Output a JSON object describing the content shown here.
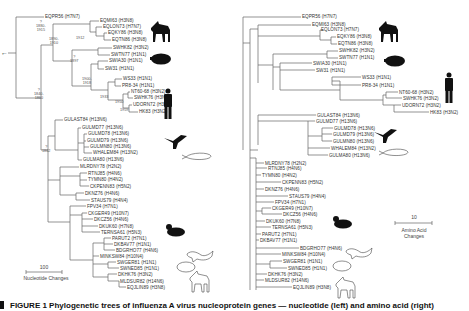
{
  "figure": {
    "caption": "FIGURE 1  Phylogenetic trees of influenza A virus nucleoprotein genes — nucleotide (left) and amino acid (right)",
    "left_tree": {
      "scale_value": "100",
      "scale_label": "Nucleotide Changes",
      "root_arrow": "←",
      "dates": [
        {
          "text": "1912",
          "x": 80,
          "y": 37
        },
        {
          "text": "1880-\n1910",
          "x": 8,
          "y": 32
        },
        {
          "text": "?\n1880-\n1915",
          "x": 127,
          "y": 40
        },
        {
          "text": "?\n1897",
          "x": 151,
          "y": 63
        },
        {
          "text": "1900-\n1918",
          "x": 107,
          "y": 93
        },
        {
          "text": "1933",
          "x": 130,
          "y": 95
        },
        {
          "text": "1950",
          "x": 117,
          "y": 118
        },
        {
          "text": "1959",
          "x": 100,
          "y": 127
        },
        {
          "text": "?\n1840-\n1860",
          "x": 31,
          "y": 97
        },
        {
          "text": "?\n1862",
          "x": 42,
          "y": 119
        }
      ],
      "taxa": [
        {
          "name": "EQPR56 (H7N7)",
          "x": 45,
          "y": 16
        },
        {
          "name": "EQMI63 (H3N8)",
          "x": 100,
          "y": 20
        },
        {
          "name": "EQLON73 (H7N7)",
          "x": 103,
          "y": 26
        },
        {
          "name": "EQKY86 (H3N8)",
          "x": 108,
          "y": 32
        },
        {
          "name": "EQTN86 (H3N8)",
          "x": 112,
          "y": 39
        },
        {
          "name": "SWHK82 (H3N2)",
          "x": 113,
          "y": 47
        },
        {
          "name": "SWTN77 (H1N1)",
          "x": 111,
          "y": 54
        },
        {
          "name": "SWIA30 (H1N1)",
          "x": 109,
          "y": 60
        },
        {
          "name": "SW31 (H1N1)",
          "x": 105,
          "y": 68
        },
        {
          "name": "WS33 (H1N1)",
          "x": 123,
          "y": 78
        },
        {
          "name": "PR8-34 (H1N1)",
          "x": 122,
          "y": 85
        },
        {
          "name": "NT60-68 (H3N2)",
          "x": 131,
          "y": 91
        },
        {
          "name": "SWHK76 (H3N2)",
          "x": 134,
          "y": 97
        },
        {
          "name": "UDORN72 (H3N2)",
          "x": 133,
          "y": 104
        },
        {
          "name": "HK83 (H3N2)",
          "x": 139,
          "y": 111
        },
        {
          "name": "GULAST84 (H13N6)",
          "x": 64,
          "y": 119
        },
        {
          "name": "GULMD77 (H13N6)",
          "x": 82,
          "y": 127
        },
        {
          "name": "GULMD78 (H13N6)",
          "x": 88,
          "y": 133
        },
        {
          "name": "GULMD79 (H13N6)",
          "x": 87,
          "y": 140
        },
        {
          "name": "GULMN80 (H13N6)",
          "x": 90,
          "y": 146
        },
        {
          "name": "WHALEM84 (H13N2)",
          "x": 93,
          "y": 152
        },
        {
          "name": "GULMA80 (H13N6)",
          "x": 83,
          "y": 159
        },
        {
          "name": "MLRDNY78 (H2N2)",
          "x": 80,
          "y": 166
        },
        {
          "name": "RTNJ85 (H4N6)",
          "x": 88,
          "y": 172
        },
        {
          "name": "TYMN80 (H4N2)",
          "x": 88,
          "y": 179
        },
        {
          "name": "CKPENN83 (H5N2)",
          "x": 90,
          "y": 185
        },
        {
          "name": "DKNZ76 (H4N6)",
          "x": 85,
          "y": 192
        },
        {
          "name": "STAUS79 (H4N4)",
          "x": 91,
          "y": 199
        },
        {
          "name": "FPV34 (H7N1)",
          "x": 87,
          "y": 205
        },
        {
          "name": "CKGER49 (H10N7)",
          "x": 88,
          "y": 212
        },
        {
          "name": "DKCZ56 (H4N6)",
          "x": 94,
          "y": 218
        },
        {
          "name": "DKUK60 (H7N8)",
          "x": 99,
          "y": 225
        },
        {
          "name": "TERNSA61 (H5N3)",
          "x": 101,
          "y": 231
        },
        {
          "name": "PARUT2 (H7N1)",
          "x": 112,
          "y": 237
        },
        {
          "name": "DKBAV77 (H1N1)",
          "x": 114,
          "y": 243
        },
        {
          "name": "BDGRHO77 (H4N6)",
          "x": 116,
          "y": 249
        },
        {
          "name": "MINKSW84 (H10N4)",
          "x": 100,
          "y": 255
        },
        {
          "name": "SWGER81 (H1N1)",
          "x": 117,
          "y": 261
        },
        {
          "name": "SWNED85 (H1N1)",
          "x": 120,
          "y": 267
        },
        {
          "name": "DKHK76 (H3N2)",
          "x": 118,
          "y": 273
        },
        {
          "name": "MLDSUR82 (H14N6)",
          "x": 120,
          "y": 280
        },
        {
          "name": "EQJLIN89 (H3N8)",
          "x": 127,
          "y": 286
        }
      ]
    },
    "right_tree": {
      "scale_value": "10",
      "scale_label_line1": "Amino Acid",
      "scale_label_line2": "Changes",
      "taxa": [
        {
          "name": "EQPR56 (H7N7)",
          "x": 302,
          "y": 16
        },
        {
          "name": "EQMI63 (H3N8)",
          "x": 312,
          "y": 24
        },
        {
          "name": "EQLON73 (H7N7)",
          "x": 321,
          "y": 29
        },
        {
          "name": "EQKY86 (H3N8)",
          "x": 337,
          "y": 36
        },
        {
          "name": "EQTN86 (H3N8)",
          "x": 338,
          "y": 43
        },
        {
          "name": "SWHK82 (H3N2)",
          "x": 339,
          "y": 50
        },
        {
          "name": "SWTN77 (H1N1)",
          "x": 339,
          "y": 57
        },
        {
          "name": "SWIA30 (H1N1)",
          "x": 313,
          "y": 62
        },
        {
          "name": "SW31 (H1N1)",
          "x": 316,
          "y": 69
        },
        {
          "name": "WS33 (H1N1)",
          "x": 362,
          "y": 76
        },
        {
          "name": "PR8-34 (H1N1)",
          "x": 362,
          "y": 84
        },
        {
          "name": "NT60-68 (H3N2)",
          "x": 399,
          "y": 91
        },
        {
          "name": "SWHK76 (H3N2)",
          "x": 403,
          "y": 97
        },
        {
          "name": "UDORN72 (H3N2)",
          "x": 402,
          "y": 104
        },
        {
          "name": "HK83 (H3N2)",
          "x": 430,
          "y": 111
        },
        {
          "name": "GULAST84 (H13N6)",
          "x": 317,
          "y": 114
        },
        {
          "name": "GULMD77 (H13N6)",
          "x": 316,
          "y": 120
        },
        {
          "name": "GULMD78 (H13N6)",
          "x": 334,
          "y": 127
        },
        {
          "name": "GULMD79 (H13N6)",
          "x": 333,
          "y": 133
        },
        {
          "name": "GULMN80 (H13N6)",
          "x": 333,
          "y": 140
        },
        {
          "name": "WHALEM84 (H13N2)",
          "x": 331,
          "y": 147
        },
        {
          "name": "GULMA80 (H13N6)",
          "x": 329,
          "y": 154
        },
        {
          "name": "MLRDNY78 (H2N2)",
          "x": 265,
          "y": 162
        },
        {
          "name": "RTNJ85 (H4N6)",
          "x": 268,
          "y": 167
        },
        {
          "name": "TYMN80 (H4N2)",
          "x": 262,
          "y": 174
        },
        {
          "name": "CKPENN83 (H5N2)",
          "x": 282,
          "y": 181
        },
        {
          "name": "DKNZ76 (H4N6)",
          "x": 265,
          "y": 188
        },
        {
          "name": "STAUS79 (H4N4)",
          "x": 289,
          "y": 195
        },
        {
          "name": "FPV34 (H7N1)",
          "x": 275,
          "y": 201
        },
        {
          "name": "CKGER49 (H10N7)",
          "x": 272,
          "y": 207
        },
        {
          "name": "DKCZ56 (H4N6)",
          "x": 283,
          "y": 213
        },
        {
          "name": "DKUK60 (H7N8)",
          "x": 266,
          "y": 220
        },
        {
          "name": "TERNSA61 (H5N3)",
          "x": 272,
          "y": 226
        },
        {
          "name": "PARUT2 (H7N1)",
          "x": 262,
          "y": 233
        },
        {
          "name": "DKBAV77 (H1N1)",
          "x": 260,
          "y": 239
        },
        {
          "name": "BDGRHO77 (H4N6)",
          "x": 300,
          "y": 247
        },
        {
          "name": "MINKSW84 (H10N4)",
          "x": 282,
          "y": 253
        },
        {
          "name": "SWGER81 (H1N1)",
          "x": 283,
          "y": 260
        },
        {
          "name": "SWNED85 (H1N1)",
          "x": 288,
          "y": 267
        },
        {
          "name": "DKHK76 (H3N2)",
          "x": 268,
          "y": 273
        },
        {
          "name": "MLDSUR82 (H14N6)",
          "x": 265,
          "y": 279
        },
        {
          "name": "EQJLIN89 (H3N8)",
          "x": 293,
          "y": 286
        }
      ]
    },
    "hosts": [
      "horse",
      "pig",
      "human",
      "bird",
      "whale",
      "duck",
      "mink",
      "pig",
      "horse"
    ]
  }
}
